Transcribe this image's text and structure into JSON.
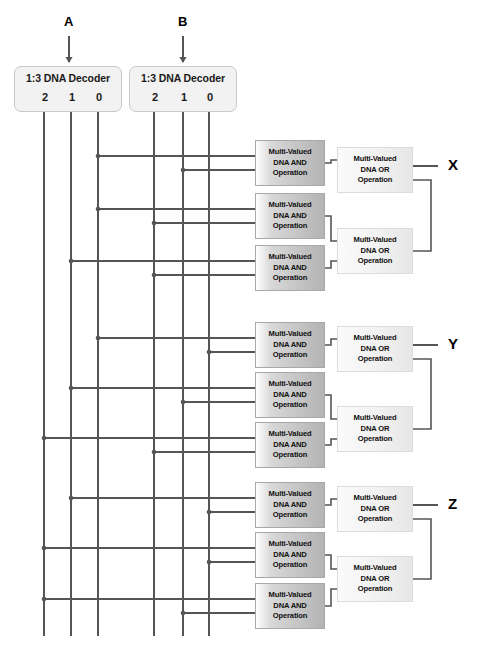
{
  "diagram": {
    "colors": {
      "wire": "#555555",
      "and_fill": "#b8b8b8",
      "or_fill": "#f0f0f0",
      "decoder_fill": "#f2f2f2",
      "text": "#111111"
    },
    "inputs": [
      {
        "label": "A",
        "x": 69,
        "arrow_y_top": 36,
        "arrow_y_bottom": 62
      },
      {
        "label": "B",
        "x": 183,
        "arrow_y_top": 36,
        "arrow_y_bottom": 62
      }
    ],
    "decoders": [
      {
        "name": "decoder-a",
        "title": "1:3 DNA Decoder",
        "pins": [
          "2",
          "1",
          "0"
        ],
        "x": 14,
        "y": 66,
        "w": 108,
        "h": 46,
        "pin_x": [
          44,
          71,
          98
        ]
      },
      {
        "name": "decoder-b",
        "title": "1:3 DNA Decoder",
        "pins": [
          "2",
          "1",
          "0"
        ],
        "x": 129,
        "y": 66,
        "w": 108,
        "h": 46,
        "pin_x": [
          154,
          183,
          209
        ]
      }
    ],
    "and_gate_label": [
      "Multi-Valued",
      "DNA AND",
      "Operation"
    ],
    "or_gate_label": [
      "Multi-Valued",
      "DNA OR",
      "Operation"
    ],
    "outputs": [
      {
        "label": "X",
        "x": 448,
        "y": 166
      },
      {
        "label": "Y",
        "x": 448,
        "y": 345
      },
      {
        "label": "Z",
        "x": 448,
        "y": 505
      }
    ],
    "blocks": [
      {
        "name": "block-x",
        "output": "X",
        "and_gates": [
          {
            "y": 140,
            "top_src_x": 98,
            "bot_src_x": 183
          },
          {
            "y": 193,
            "top_src_x": 98,
            "bot_src_x": 154
          },
          {
            "y": 245,
            "top_src_x": 71,
            "bot_src_x": 154
          }
        ],
        "or_gates": [
          {
            "y": 147,
            "name": "or-top"
          },
          {
            "y": 228,
            "name": "or-bottom"
          }
        ]
      },
      {
        "name": "block-y",
        "output": "Y",
        "and_gates": [
          {
            "y": 322,
            "top_src_x": 98,
            "bot_src_x": 209
          },
          {
            "y": 372,
            "top_src_x": 71,
            "bot_src_x": 183
          },
          {
            "y": 422,
            "top_src_x": 44,
            "bot_src_x": 154
          }
        ],
        "or_gates": [
          {
            "y": 326,
            "name": "or-top"
          },
          {
            "y": 406,
            "name": "or-bottom"
          }
        ]
      },
      {
        "name": "block-z",
        "output": "Z",
        "and_gates": [
          {
            "y": 482,
            "top_src_x": 71,
            "bot_src_x": 209
          },
          {
            "y": 532,
            "top_src_x": 44,
            "bot_src_x": 209
          },
          {
            "y": 583,
            "top_src_x": 44,
            "bot_src_x": 183
          }
        ],
        "or_gates": [
          {
            "y": 486,
            "name": "or-top"
          },
          {
            "y": 556,
            "name": "or-bottom"
          }
        ]
      }
    ],
    "geometry": {
      "and_x": 255,
      "and_w": 70,
      "and_h": 46,
      "or_x": 337,
      "or_w": 76,
      "or_h": 46,
      "bus_bottom_y": 636,
      "bus_top_y": 112
    }
  }
}
